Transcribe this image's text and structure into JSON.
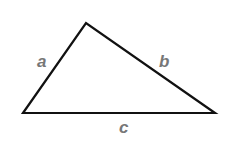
{
  "diagram": {
    "type": "triangle",
    "vertices": {
      "left": [
        23,
        113
      ],
      "top": [
        86,
        23
      ],
      "right": [
        215,
        113
      ]
    },
    "stroke_color": "#111111",
    "label_color": "#777777",
    "sides": [
      {
        "name": "a",
        "label": "a",
        "between": [
          "left",
          "top"
        ]
      },
      {
        "name": "b",
        "label": "b",
        "between": [
          "top",
          "right"
        ]
      },
      {
        "name": "c",
        "label": "c",
        "between": [
          "left",
          "right"
        ]
      }
    ]
  }
}
